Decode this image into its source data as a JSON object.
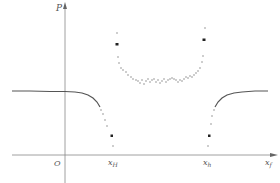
{
  "figure": {
    "axes": {
      "y_label": "P",
      "x_label_main": "x",
      "x_label_sub": "f",
      "origin_label": "O"
    },
    "x_ticks": [
      {
        "main": "x",
        "sub": "H",
        "x": 113
      },
      {
        "main": "x",
        "sub": "h",
        "x": 208
      }
    ],
    "colors": {
      "axis": "#888888",
      "curve": "#555555",
      "points": "#666666",
      "marker": "#222222"
    }
  }
}
